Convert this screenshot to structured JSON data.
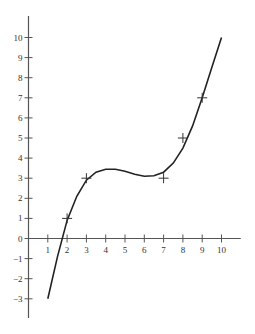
{
  "chart_data": {
    "type": "scatter",
    "title": "",
    "xlabel": "",
    "ylabel": "",
    "xlim": [
      0,
      11
    ],
    "ylim": [
      -4,
      11
    ],
    "grid": false,
    "x_ticks": [
      1,
      2,
      3,
      4,
      5,
      6,
      7,
      8,
      9,
      10
    ],
    "y_ticks": [
      -3,
      -2,
      -1,
      0,
      1,
      2,
      3,
      4,
      5,
      6,
      7,
      8,
      9,
      10
    ],
    "series": [
      {
        "name": "data points",
        "marker": "+",
        "points": [
          [
            2,
            1
          ],
          [
            3,
            3
          ],
          [
            7,
            3
          ],
          [
            8,
            5
          ],
          [
            9,
            7
          ]
        ]
      },
      {
        "name": "fitted cubic curve",
        "kind": "line",
        "points": [
          [
            1,
            -3
          ],
          [
            1.5,
            -0.9
          ],
          [
            2,
            0.9
          ],
          [
            2.5,
            2.1
          ],
          [
            3,
            2.9
          ],
          [
            3.5,
            3.3
          ],
          [
            4,
            3.45
          ],
          [
            4.5,
            3.45
          ],
          [
            5,
            3.35
          ],
          [
            5.5,
            3.2
          ],
          [
            6,
            3.1
          ],
          [
            6.5,
            3.12
          ],
          [
            7,
            3.3
          ],
          [
            7.5,
            3.75
          ],
          [
            8,
            4.5
          ],
          [
            8.5,
            5.6
          ],
          [
            9,
            7
          ],
          [
            9.5,
            8.5
          ],
          [
            10,
            10
          ]
        ]
      }
    ],
    "colors": {
      "axis": "#555555",
      "curve": "#222222",
      "marker": "#333333"
    }
  }
}
